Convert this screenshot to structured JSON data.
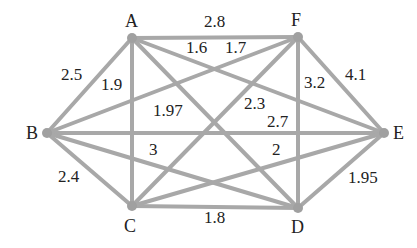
{
  "graph": {
    "nodes": [
      {
        "id": "A",
        "x": 132,
        "y": 38,
        "lx": 125,
        "ly": 12
      },
      {
        "id": "F",
        "x": 298,
        "y": 37,
        "lx": 291,
        "ly": 11
      },
      {
        "id": "B",
        "x": 47,
        "y": 133,
        "lx": 26,
        "ly": 124
      },
      {
        "id": "E",
        "x": 384,
        "y": 133,
        "lx": 393,
        "ly": 124
      },
      {
        "id": "C",
        "x": 132,
        "y": 206,
        "lx": 124,
        "ly": 217
      },
      {
        "id": "D",
        "x": 298,
        "y": 208,
        "lx": 291,
        "ly": 218
      }
    ],
    "edges": [
      {
        "from": "A",
        "to": "F",
        "weight": "2.8",
        "lx": 204,
        "ly": 13
      },
      {
        "from": "A",
        "to": "B",
        "weight": "2.5",
        "lx": 61,
        "ly": 66
      },
      {
        "from": "A",
        "to": "C",
        "weight": "1.9",
        "lx": 101,
        "ly": 76
      },
      {
        "from": "A",
        "to": "D",
        "weight": "1.97",
        "lx": 153,
        "ly": 102
      },
      {
        "from": "A",
        "to": "E",
        "weight": "1.6",
        "lx": 186,
        "ly": 39
      },
      {
        "from": "B",
        "to": "F",
        "weight": "1.7",
        "lx": 225,
        "ly": 39
      },
      {
        "from": "C",
        "to": "F",
        "weight": "2.3",
        "lx": 244,
        "ly": 95
      },
      {
        "from": "F",
        "to": "D",
        "weight": "3.2",
        "lx": 304,
        "ly": 74
      },
      {
        "from": "F",
        "to": "E",
        "weight": "4.1",
        "lx": 345,
        "ly": 66
      },
      {
        "from": "B",
        "to": "E",
        "weight": "2.7",
        "lx": 267,
        "ly": 113
      },
      {
        "from": "B",
        "to": "D",
        "weight": "3",
        "lx": 149,
        "ly": 141
      },
      {
        "from": "C",
        "to": "E",
        "weight": "2",
        "lx": 272,
        "ly": 141
      },
      {
        "from": "B",
        "to": "C",
        "weight": "2.4",
        "lx": 58,
        "ly": 168
      },
      {
        "from": "C",
        "to": "D",
        "weight": "1.8",
        "lx": 204,
        "ly": 209
      },
      {
        "from": "D",
        "to": "E",
        "weight": "1.95",
        "lx": 348,
        "ly": 169
      }
    ]
  }
}
